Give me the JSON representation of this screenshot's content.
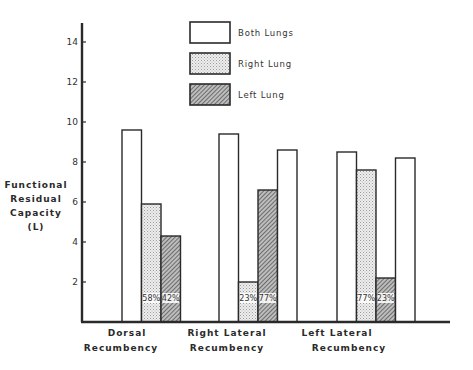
{
  "chart_data": {
    "type": "bar",
    "title": "",
    "ylabel": "Functional Residual Capacity (L)",
    "ylabel_lines": [
      "Functional",
      "Residual",
      "Capacity",
      "(L)"
    ],
    "xlabel": "",
    "ylim": [
      0,
      15
    ],
    "yticks": [
      2,
      4,
      6,
      8,
      10,
      12,
      14
    ],
    "grid": false,
    "legend_position": "top-center",
    "legend": [
      {
        "name": "Both Lungs",
        "pattern": "white"
      },
      {
        "name": "Right Lung",
        "pattern": "stipple"
      },
      {
        "name": "Left Lung",
        "pattern": "hatch"
      }
    ],
    "categories": [
      {
        "label_lines": [
          "Dorsal",
          "Recumbency"
        ],
        "label": "Dorsal Recumbency"
      },
      {
        "label_lines": [
          "Right Lateral",
          "Recumbency"
        ],
        "label": "Right Lateral Recumbency"
      },
      {
        "label_lines": [
          "Left Lateral",
          "Recumbency"
        ],
        "label": "Left Lateral Recumbency"
      }
    ],
    "groups": [
      {
        "category": "Dorsal Recumbency",
        "bars": [
          {
            "series": "Both Lungs",
            "value": 9.6
          },
          {
            "series": "Right Lung",
            "value": 5.9,
            "annotation": "58%"
          },
          {
            "series": "Left Lung",
            "value": 4.3,
            "annotation": "42%"
          }
        ]
      },
      {
        "category": "Right Lateral Recumbency",
        "bars": [
          {
            "series": "Both Lungs",
            "value": 9.4
          },
          {
            "series": "Right Lung",
            "value": 2.0,
            "annotation": "23%"
          },
          {
            "series": "Left Lung",
            "value": 6.6,
            "annotation": "77%"
          },
          {
            "series": "Both Lungs",
            "value": 8.6
          }
        ]
      },
      {
        "category": "Left Lateral Recumbency",
        "bars": [
          {
            "series": "Both Lungs",
            "value": 8.5
          },
          {
            "series": "Right Lung",
            "value": 7.6,
            "annotation": "77%"
          },
          {
            "series": "Left Lung",
            "value": 2.2,
            "annotation": "23%"
          },
          {
            "series": "Both Lungs",
            "value": 8.2
          }
        ]
      }
    ]
  }
}
